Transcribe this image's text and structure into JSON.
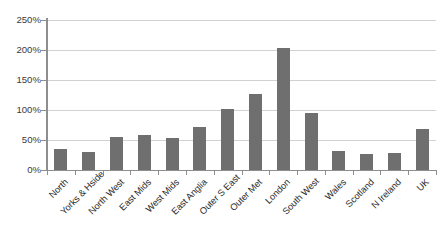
{
  "chart_data": {
    "type": "bar",
    "title": "",
    "subtitle": "",
    "xlabel": "",
    "ylabel": "",
    "ylim": [
      0,
      250
    ],
    "yunit": "%",
    "grid": true,
    "legend": "none",
    "bar_color": "#6f6f6f",
    "gridline_color": "#d2d2d2",
    "axis_color": "#8e8e8e",
    "background_color": "#ffffff",
    "label_rotation_deg": -45,
    "ytick_labels": [
      "0%",
      "50%",
      "100%",
      "150%",
      "200%",
      "250%"
    ],
    "ytick_values": [
      0,
      50,
      100,
      150,
      200,
      250
    ],
    "categories": [
      "North",
      "Yorks & Hside",
      "North West",
      "East Mids",
      "West Mids",
      "East Anglia",
      "Outer S East",
      "Outer Met",
      "London",
      "South West",
      "Wales",
      "Scotland",
      "N Ireland",
      "UK"
    ],
    "values": [
      35,
      30,
      55,
      59,
      53,
      72,
      101,
      127,
      203,
      95,
      31,
      27,
      29,
      69
    ]
  }
}
